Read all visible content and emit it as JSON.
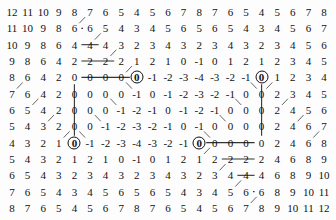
{
  "figure": {
    "kind": "numeric-lattice-grid",
    "rows": 13,
    "cols": 21,
    "background_color": "#fdfdfd",
    "text_color": "#111111",
    "edge_color": "#555555",
    "circle_marker_color": "#111111"
  },
  "chart_data": {
    "type": "heatmap",
    "title": "",
    "subtitle": "",
    "xlabel": "",
    "ylabel": "",
    "grid": false,
    "legend": "none",
    "nrows": 13,
    "ncols": 21,
    "values": [
      [
        12,
        11,
        10,
        9,
        8,
        7,
        6,
        5,
        4,
        5,
        6,
        7,
        8,
        7,
        6,
        5,
        4,
        5,
        6,
        7,
        8
      ],
      [
        11,
        10,
        9,
        8,
        6,
        6,
        5,
        4,
        3,
        4,
        5,
        6,
        5,
        6,
        5,
        4,
        3,
        4,
        5,
        6,
        7
      ],
      [
        10,
        9,
        8,
        6,
        4,
        4,
        4,
        3,
        2,
        3,
        4,
        3,
        2,
        3,
        4,
        3,
        2,
        3,
        4,
        5,
        6
      ],
      [
        9,
        8,
        6,
        4,
        2,
        2,
        2,
        2,
        1,
        2,
        1,
        0,
        -1,
        0,
        1,
        2,
        1,
        2,
        3,
        4,
        5
      ],
      [
        8,
        6,
        4,
        2,
        0,
        0,
        0,
        0,
        0,
        -1,
        -2,
        -3,
        -4,
        -3,
        -2,
        -1,
        0,
        1,
        2,
        3,
        4
      ],
      [
        7,
        6,
        4,
        2,
        0,
        0,
        0,
        0,
        -1,
        0,
        -1,
        -2,
        -3,
        -2,
        -1,
        0,
        0,
        2,
        3,
        4,
        5
      ],
      [
        6,
        5,
        4,
        2,
        0,
        0,
        0,
        -1,
        -2,
        -1,
        0,
        -1,
        -2,
        -1,
        0,
        0,
        0,
        2,
        4,
        5,
        6
      ],
      [
        5,
        4,
        3,
        2,
        0,
        0,
        -1,
        -2,
        -3,
        -2,
        -1,
        0,
        -1,
        0,
        0,
        0,
        0,
        2,
        4,
        6,
        7
      ],
      [
        4,
        3,
        2,
        1,
        0,
        -1,
        -2,
        -3,
        -4,
        -3,
        -2,
        -1,
        0,
        0,
        0,
        0,
        0,
        2,
        4,
        6,
        8
      ],
      [
        5,
        4,
        3,
        2,
        1,
        2,
        1,
        0,
        -1,
        0,
        1,
        2,
        1,
        2,
        2,
        2,
        2,
        4,
        6,
        8,
        9
      ],
      [
        6,
        5,
        4,
        3,
        2,
        3,
        4,
        3,
        2,
        3,
        4,
        3,
        2,
        3,
        4,
        4,
        4,
        6,
        8,
        9,
        10
      ],
      [
        7,
        6,
        5,
        4,
        3,
        4,
        5,
        6,
        5,
        6,
        5,
        4,
        3,
        4,
        5,
        6,
        6,
        8,
        9,
        10,
        11
      ],
      [
        8,
        7,
        6,
        5,
        4,
        5,
        6,
        7,
        8,
        7,
        6,
        5,
        4,
        5,
        6,
        7,
        8,
        9,
        10,
        11,
        12
      ]
    ],
    "circled_cells": [
      {
        "row": 4,
        "col": 8,
        "value": 0
      },
      {
        "row": 4,
        "col": 16,
        "value": 0
      },
      {
        "row": 8,
        "col": 4,
        "value": 0
      },
      {
        "row": 8,
        "col": 12,
        "value": 0
      }
    ],
    "edges": {
      "note": "links drawn between adjacent labelled cells",
      "horizontal": [
        {
          "row": 1,
          "from_col": 4,
          "to_col": 5
        },
        {
          "row": 2,
          "from_col": 4,
          "to_col": 6
        },
        {
          "row": 3,
          "from_col": 4,
          "to_col": 7
        },
        {
          "row": 4,
          "from_col": 4,
          "to_col": 8
        },
        {
          "row": 8,
          "from_col": 12,
          "to_col": 16
        },
        {
          "row": 9,
          "from_col": 13,
          "to_col": 16
        },
        {
          "row": 10,
          "from_col": 14,
          "to_col": 16
        },
        {
          "row": 11,
          "from_col": 15,
          "to_col": 16
        }
      ],
      "vertical": [
        {
          "col": 4,
          "from_row": 4,
          "to_row": 8
        },
        {
          "col": 16,
          "from_row": 4,
          "to_row": 8
        }
      ],
      "diagonal_style": "chevron links between neighbouring rows"
    }
  }
}
